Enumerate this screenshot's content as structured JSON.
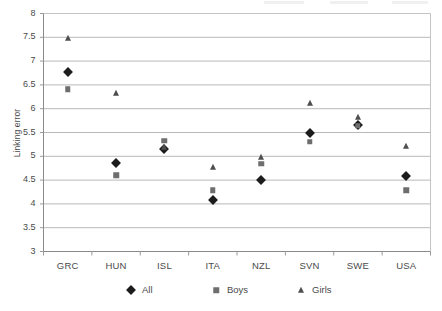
{
  "chart_data": {
    "type": "scatter",
    "title": "",
    "xlabel": "",
    "ylabel": "Linking error",
    "categories": [
      "GRC",
      "HUN",
      "ISL",
      "ITA",
      "NZL",
      "SVN",
      "SWE",
      "USA"
    ],
    "ylim": [
      3,
      8
    ],
    "ytick_labels": [
      "3",
      "3.5",
      "4",
      "4.5",
      "5",
      "5.5",
      "6",
      "6.5",
      "7",
      "7.5",
      "8"
    ],
    "ytick_values": [
      3,
      3.5,
      4,
      4.5,
      5,
      5.5,
      6,
      6.5,
      7,
      7.5,
      8
    ],
    "grid": true,
    "legend_position": "bottom",
    "series": [
      {
        "name": "All",
        "marker": "diamond",
        "color": "#1c1c1c",
        "values": [
          6.77,
          4.85,
          5.16,
          4.09,
          4.5,
          5.49,
          5.65,
          4.59
        ]
      },
      {
        "name": "Boys",
        "marker": "square",
        "color": "#6e6e6e",
        "values": [
          6.41,
          4.6,
          5.33,
          4.29,
          4.84,
          5.31,
          5.64,
          4.29
        ]
      },
      {
        "name": "Girls",
        "marker": "triangle",
        "color": "#4e4e4e",
        "values": [
          7.48,
          6.33,
          5.2,
          4.78,
          4.99,
          6.12,
          5.82,
          5.22
        ]
      }
    ]
  },
  "legend": {
    "items": [
      {
        "label": "All",
        "marker": "diamond"
      },
      {
        "label": "Boys",
        "marker": "square"
      },
      {
        "label": "Girls",
        "marker": "triangle"
      }
    ]
  },
  "axis": {
    "y_title": "Linking error"
  },
  "colors": {
    "all": "#1c1c1c",
    "boys": "#6e6e6e",
    "girls": "#4e4e4e",
    "grid": "#b9b9b9",
    "frame": "#9a9a9a",
    "text": "#4a4a4a"
  }
}
